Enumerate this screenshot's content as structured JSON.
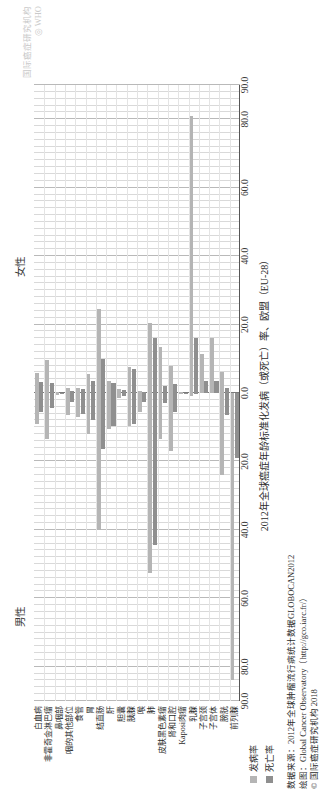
{
  "figure": {
    "male_label": "男性",
    "female_label": "女性",
    "x_axis_title": "2012年全球癌症年龄标准化发病（或死亡）率、欧盟（EU-28）"
  },
  "legend": {
    "incidence_label": "发病率",
    "mortality_label": "死亡率",
    "incidence_color": "#b5b5b5",
    "mortality_color": "#8f8f8f"
  },
  "footer": {
    "line1": "数据来源：2012年全球肿瘤流行病统计数据GLOBOCAN2012",
    "line2": "绘图：Global Cancer Observatory（http://gco.iarc.fr/）",
    "line3": "© 国际癌症研究机构 2018"
  },
  "watermark": {
    "line1": "国际癌症研究机构",
    "line2": "◎ WHO"
  },
  "chart_data": {
    "type": "bar",
    "title": "",
    "subtitle": "",
    "xlabel": "2012年全球癌症年龄标准化发病（或死亡）率、欧盟（EU-28）",
    "ylabel": "",
    "orientation": "horizontal-diverging",
    "grid": true,
    "legend_position": "bottom-left",
    "xlim": [
      -90,
      90
    ],
    "xticks": [
      -90,
      -80,
      -60,
      -40,
      -20,
      0,
      20,
      40,
      60,
      80,
      90
    ],
    "xtick_labels": [
      "90.0",
      "80.0",
      "60.0",
      "40.0",
      "20.0",
      "0.0",
      "20.0",
      "40.0",
      "60.0",
      "80.0",
      "90.0"
    ],
    "note": "Left half = 男性 (male), right half = 女性 (female). Values are age-standardised rates per 100,000.",
    "categories": [
      "白血病",
      "非霍奇金淋巴瘤",
      "鼻咽部",
      "咽的其他部位",
      "食管",
      "胃",
      "结直肠",
      "肝",
      "胆囊",
      "胰腺",
      "喉",
      "肺",
      "皮肤黑色素瘤",
      "肾和口腔",
      "Kaposi肉瘤",
      "乳腺",
      "子宫颈",
      "子宫体",
      "膀胱",
      "前列腺"
    ],
    "series": [
      {
        "name": "男性发病率",
        "side": "male",
        "measure": "incidence",
        "color": "#b5b5b5",
        "values": [
          9.0,
          13.5,
          0.6,
          6.5,
          7.0,
          12.0,
          40.0,
          10.5,
          1.5,
          9.5,
          5.5,
          52.5,
          13.5,
          17.0,
          0.4,
          0.9,
          0.0,
          0.0,
          24.0,
          84.0
        ]
      },
      {
        "name": "男性死亡率",
        "side": "male",
        "measure": "mortality",
        "color": "#8f8f8f",
        "values": [
          5.5,
          4.5,
          0.3,
          2.5,
          6.0,
          8.0,
          16.5,
          9.5,
          1.0,
          9.0,
          2.5,
          44.5,
          3.0,
          5.5,
          0.2,
          0.2,
          0.0,
          0.0,
          6.5,
          19.0
        ]
      },
      {
        "name": "女性发病率",
        "side": "female",
        "measure": "incidence",
        "color": "#b5b5b5",
        "values": [
          5.8,
          9.5,
          0.3,
          1.5,
          1.5,
          5.5,
          24.5,
          3.5,
          1.3,
          7.5,
          0.7,
          20.5,
          13.5,
          8.0,
          0.2,
          81.0,
          11.5,
          16.0,
          6.0,
          0.0
        ]
      },
      {
        "name": "女性死亡率",
        "side": "female",
        "measure": "mortality",
        "color": "#8f8f8f",
        "values": [
          3.3,
          3.0,
          0.1,
          0.5,
          1.2,
          3.5,
          10.0,
          3.0,
          0.9,
          7.0,
          0.2,
          16.0,
          2.0,
          2.5,
          0.1,
          16.0,
          3.5,
          3.5,
          1.6,
          0.0
        ]
      }
    ]
  }
}
